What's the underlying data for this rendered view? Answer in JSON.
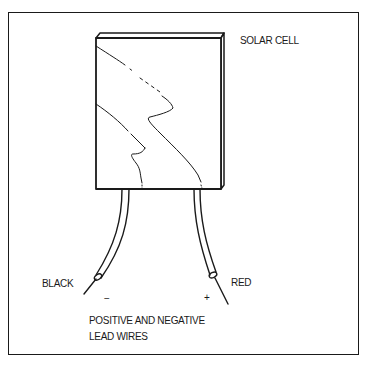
{
  "diagram": {
    "title_label": "SOLAR CELL",
    "wires": {
      "left": {
        "color_label": "BLACK",
        "polarity": "−"
      },
      "right": {
        "color_label": "RED",
        "polarity": "+"
      }
    },
    "caption": {
      "line1": "POSITIVE AND NEGATIVE",
      "line2": "LEAD WIRES"
    },
    "colors": {
      "ink": "#1a1a1a",
      "background": "#ffffff"
    }
  }
}
